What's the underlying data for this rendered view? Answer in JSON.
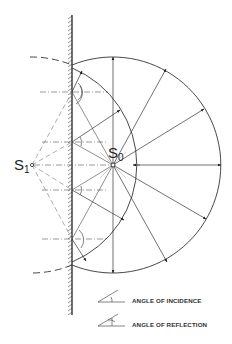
{
  "diagram": {
    "sources": [
      {
        "id": "S0",
        "label": "S",
        "subscript": "0",
        "role": "real source"
      },
      {
        "id": "S1",
        "label": "S",
        "subscript": "1",
        "role": "mirror image source"
      }
    ],
    "elements": {
      "mirror": "plane reflecting wall (hatched)",
      "incident_wavefront": "circle centered at S0",
      "reflected_wavefront": "circle centered at S1",
      "image_wavefront": "dashed arc behind mirror",
      "normals": "dash-dot lines at reflection points"
    },
    "legend": [
      {
        "symbol": "angle-of-incidence-symbol",
        "label": "ANGLE OF INCIDENCE"
      },
      {
        "symbol": "angle-of-reflection-symbol",
        "label": "ANGLE OF REFLECTION"
      }
    ],
    "colors": {
      "stroke": "#333333",
      "light_stroke": "#777777",
      "background": "#ffffff"
    }
  }
}
